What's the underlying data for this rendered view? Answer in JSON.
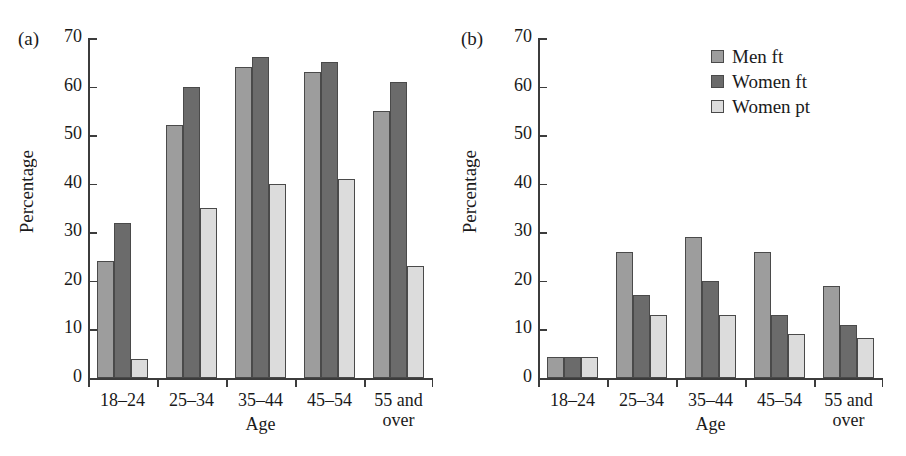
{
  "figure": {
    "panels": [
      {
        "letter": "(a)"
      },
      {
        "letter": "(b)"
      }
    ]
  },
  "axis": {
    "ylabel": "Percentage",
    "xlabel": "Age",
    "yticks": [
      "0",
      "10",
      "20",
      "30",
      "40",
      "50",
      "60",
      "70"
    ],
    "xticks": [
      "18–24",
      "25–34",
      "35–44",
      "45–54",
      "55 and\nover"
    ]
  },
  "legend": {
    "position": "top-right-panel-b",
    "entries": [
      {
        "label": "Men ft",
        "color": "#9d9d9d"
      },
      {
        "label": "Women ft",
        "color": "#6b6b6b"
      },
      {
        "label": "Women pt",
        "color": "#dcdcdc"
      }
    ]
  },
  "colors": {
    "men_ft": "#9d9d9d",
    "women_ft": "#6b6b6b",
    "women_pt": "#dcdcdc",
    "axis": "#3c3c3c",
    "text": "#1a1a1a",
    "background": "#ffffff"
  },
  "chart_data": [
    {
      "type": "bar",
      "panel": "(a)",
      "title": "",
      "xlabel": "Age",
      "ylabel": "Percentage",
      "ylim": [
        0,
        70
      ],
      "ytick_step": 10,
      "grid": false,
      "legend": false,
      "categories": [
        "18–24",
        "25–34",
        "35–44",
        "45–54",
        "55 and over"
      ],
      "series": [
        {
          "name": "Men ft",
          "color": "#9d9d9d",
          "values": [
            24,
            52,
            64,
            63,
            55
          ]
        },
        {
          "name": "Women ft",
          "color": "#6b6b6b",
          "values": [
            32,
            60,
            66,
            65,
            61
          ]
        },
        {
          "name": "Women pt",
          "color": "#dcdcdc",
          "values": [
            4,
            35,
            40,
            41,
            23
          ]
        }
      ]
    },
    {
      "type": "bar",
      "panel": "(b)",
      "title": "",
      "xlabel": "Age",
      "ylabel": "Percentage",
      "ylim": [
        0,
        70
      ],
      "ytick_step": 10,
      "grid": false,
      "legend": true,
      "legend_position": "upper right",
      "categories": [
        "18–24",
        "25–34",
        "35–44",
        "45–54",
        "55 and over"
      ],
      "series": [
        {
          "name": "Men ft",
          "color": "#9d9d9d",
          "values": [
            4.3,
            26,
            29,
            26,
            19
          ]
        },
        {
          "name": "Women ft",
          "color": "#6b6b6b",
          "values": [
            4.3,
            17,
            20,
            13,
            11
          ]
        },
        {
          "name": "Women pt",
          "color": "#dcdcdc",
          "values": [
            4.3,
            13,
            13,
            9,
            8.3
          ]
        }
      ]
    }
  ]
}
